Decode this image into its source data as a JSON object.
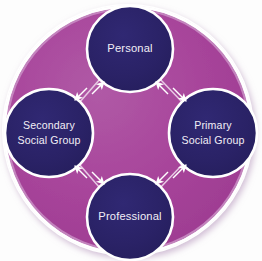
{
  "diagram": {
    "type": "cycle-diagram",
    "colors": {
      "background": "#fdfdfd",
      "disc_fill": "#a8459b",
      "disc_edge_highlight": "#c98fc4",
      "disc_outer_ring": "#ffffff",
      "node_fill": "#2a2266",
      "node_stroke": "#ffffff",
      "label_text": "#f2eef6",
      "connector": "#e7c9e4",
      "arrowhead": "#ffffff",
      "shadow": "#d8c6dd"
    },
    "nodes": [
      {
        "id": "personal",
        "label_line1": "Personal",
        "label_line2": "",
        "cx": 130,
        "cy": 49,
        "r": 43
      },
      {
        "id": "primary-social-group",
        "label_line1": "Primary",
        "label_line2": "Social Group",
        "cx": 213,
        "cy": 133,
        "r": 44
      },
      {
        "id": "professional",
        "label_line1": "Professional",
        "label_line2": "",
        "cx": 130,
        "cy": 217,
        "r": 43
      },
      {
        "id": "secondary-social-group",
        "label_line1": "Secondary",
        "label_line2": "Social Group",
        "cx": 49,
        "cy": 133,
        "r": 44
      }
    ],
    "connectors": [
      {
        "id": "personal-secondary",
        "from": "personal",
        "to": "secondary-social-group",
        "direction": "bidirectional"
      },
      {
        "id": "personal-primary",
        "from": "personal",
        "to": "primary-social-group",
        "direction": "bidirectional"
      },
      {
        "id": "professional-secondary",
        "from": "professional",
        "to": "secondary-social-group",
        "direction": "bidirectional"
      },
      {
        "id": "professional-primary",
        "from": "professional",
        "to": "primary-social-group",
        "direction": "bidirectional"
      }
    ]
  }
}
